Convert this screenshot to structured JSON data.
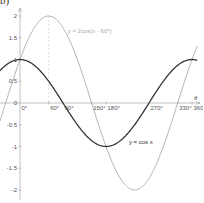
{
  "corner_label": "b)",
  "chart_data": {
    "type": "line",
    "title": "",
    "xlabel": "θ",
    "ylabel": "",
    "xlim": [
      -40,
      370
    ],
    "ylim": [
      -2.2,
      2.3
    ],
    "grid": false,
    "x_ticks": [
      {
        "value": 0,
        "label": "0°"
      },
      {
        "value": 60,
        "label": "60°"
      },
      {
        "value": 90,
        "label": "90°"
      },
      {
        "value": 150,
        "label": "150°"
      },
      {
        "value": 180,
        "label": "180°"
      },
      {
        "value": 270,
        "label": "270°"
      },
      {
        "value": 330,
        "label": "330°"
      },
      {
        "value": 360,
        "label": "360°"
      }
    ],
    "y_ticks": [
      {
        "value": 2,
        "label": "2"
      },
      {
        "value": 1.5,
        "label": "1.5"
      },
      {
        "value": 1,
        "label": "1"
      },
      {
        "value": 0.5,
        "label": "0.5"
      },
      {
        "value": 0,
        "label": "0"
      },
      {
        "value": -0.5,
        "label": "-0.5"
      },
      {
        "value": -1,
        "label": "-1"
      },
      {
        "value": -1.5,
        "label": "-1.5"
      },
      {
        "value": -2,
        "label": "-2"
      }
    ],
    "series": [
      {
        "name": "y = cos x",
        "color": "#333333",
        "amplitude": 1,
        "phase_deg": 0,
        "label_pos": {
          "x": 228,
          "y": -0.95
        },
        "x": [
          0,
          60,
          90,
          150,
          180,
          270,
          330,
          360
        ],
        "values": [
          1,
          0.5,
          0,
          -0.866,
          -1,
          0,
          0.866,
          1
        ]
      },
      {
        "name": "y = 2cos(x - 60°)",
        "color": "#aaaaaa",
        "amplitude": 2,
        "phase_deg": 60,
        "label_pos": {
          "x": 100,
          "y": 1.6
        },
        "x": [
          0,
          60,
          90,
          150,
          180,
          240,
          330,
          360
        ],
        "values": [
          1,
          2,
          1.732,
          0,
          -1,
          -2,
          0,
          1
        ]
      }
    ],
    "annotations": [
      {
        "type": "dashed-vertical",
        "x": 60,
        "y_from": 0,
        "y_to": 2,
        "color": "#cccccc"
      }
    ]
  }
}
